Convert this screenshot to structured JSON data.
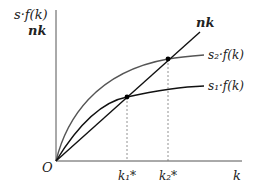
{
  "diagram": {
    "y_axis_label_line1": "s·f(k)",
    "y_axis_label_line2": "nk",
    "x_axis_label": "k",
    "origin_label": "O",
    "curves": {
      "investment_line": "nk",
      "high_saving": "s₂·f(k)",
      "low_saving": "s₁·f(k)"
    },
    "equilibria": {
      "k1": "k₁*",
      "k2": "k₂*"
    },
    "colors": {
      "axis": "#555555",
      "nk_line": "#111111",
      "s1_curve": "#111111",
      "s2_curve": "#555555",
      "dashed": "#777777"
    }
  }
}
